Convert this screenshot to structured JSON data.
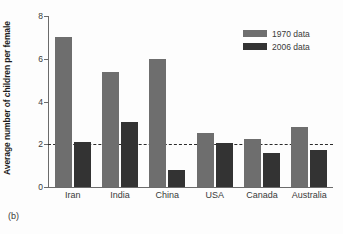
{
  "caption": "(b)",
  "chart_data": {
    "type": "bar",
    "title": "",
    "xlabel": "",
    "ylabel": "Average number of children per female",
    "ylim": [
      0,
      8
    ],
    "yticks": [
      0,
      2,
      4,
      6,
      8
    ],
    "ytick_labels": [
      "0",
      "2",
      "4",
      "6",
      "8"
    ],
    "grid": false,
    "legend_position": "top-right",
    "categories": [
      "Iran",
      "India",
      "China",
      "USA",
      "Canada",
      "Australia"
    ],
    "series": [
      {
        "name": "1970 data",
        "color": "#6e6e6e",
        "values": [
          7.0,
          5.4,
          6.0,
          2.55,
          2.25,
          2.8
        ]
      },
      {
        "name": "2006 data",
        "color": "#333333",
        "values": [
          2.1,
          3.05,
          0.8,
          2.05,
          1.6,
          1.72
        ]
      }
    ],
    "annotations": [
      {
        "type": "reference-line",
        "orientation": "horizontal",
        "value": 2.0,
        "style": "dashed",
        "color": "#2b2b2b"
      }
    ]
  }
}
